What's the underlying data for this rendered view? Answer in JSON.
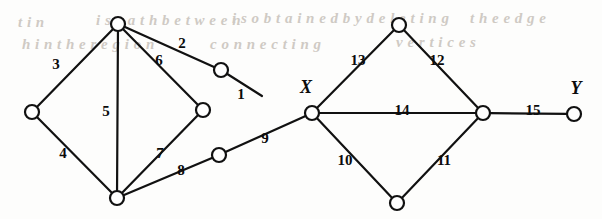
{
  "figure": {
    "kind": "undirected-weighted-graph",
    "background": "#fdfdfc",
    "ink_color": "#111111",
    "node_fill": "#ffffff",
    "node_radius": 7,
    "edge_stroke_width": 2.2
  },
  "ghost_text": [
    {
      "id": "g1",
      "text": "t i n",
      "x": 18,
      "y": 14,
      "size": 15,
      "rot": 0
    },
    {
      "id": "g2",
      "text": "i s   p a t h   b e t w e e n",
      "x": 96,
      "y": 12,
      "size": 15,
      "rot": 0
    },
    {
      "id": "g3",
      "text": "i s   o b t a i n e d   b y   d e l e t i n g",
      "x": 232,
      "y": 10,
      "size": 15,
      "rot": 0
    },
    {
      "id": "g4",
      "text": "t h e   e d g e",
      "x": 470,
      "y": 10,
      "size": 15,
      "rot": 0
    },
    {
      "id": "g5",
      "text": "h   i n   t h e   r e g i o n",
      "x": 22,
      "y": 36,
      "size": 15,
      "rot": 0
    },
    {
      "id": "g6",
      "text": "c o n n e c t i n g",
      "x": 210,
      "y": 36,
      "size": 15,
      "rot": 0
    },
    {
      "id": "g7",
      "text": "v e r t i c e s",
      "x": 396,
      "y": 34,
      "size": 15,
      "rot": 0
    }
  ],
  "nodes": [
    {
      "id": "a",
      "x": 118,
      "y": 24,
      "label": "",
      "label_dx": 0,
      "label_dy": 0
    },
    {
      "id": "b",
      "x": 32,
      "y": 112,
      "label": "",
      "label_dx": 0,
      "label_dy": 0
    },
    {
      "id": "c",
      "x": 117,
      "y": 198,
      "label": "",
      "label_dx": 0,
      "label_dy": 0
    },
    {
      "id": "d",
      "x": 203,
      "y": 110,
      "label": "",
      "label_dx": 0,
      "label_dy": 0
    },
    {
      "id": "e",
      "x": 221,
      "y": 70,
      "label": "",
      "label_dx": 0,
      "label_dy": 0
    },
    {
      "id": "f",
      "x": 219,
      "y": 155,
      "label": "",
      "label_dx": 0,
      "label_dy": 0
    },
    {
      "id": "x",
      "x": 312,
      "y": 113,
      "label": "X",
      "label_dx": -6,
      "label_dy": -24
    },
    {
      "id": "t",
      "x": 399,
      "y": 25,
      "label": "",
      "label_dx": 0,
      "label_dy": 0
    },
    {
      "id": "bm",
      "x": 397,
      "y": 203,
      "label": "",
      "label_dx": 0,
      "label_dy": 0
    },
    {
      "id": "r",
      "x": 483,
      "y": 113,
      "label": "",
      "label_dx": 0,
      "label_dy": 0
    },
    {
      "id": "y",
      "x": 574,
      "y": 114,
      "label": "Y",
      "label_dx": 2,
      "label_dy": -24
    }
  ],
  "edges": [
    {
      "id": "e1",
      "weight": "1",
      "from": "e",
      "to": "end1",
      "x2": 262,
      "y2": 96,
      "lx": 241,
      "ly": 96
    },
    {
      "id": "e2",
      "weight": "2",
      "from": "a",
      "to": "e",
      "x2": 0,
      "y2": 0,
      "lx": 182,
      "ly": 45
    },
    {
      "id": "e3",
      "weight": "3",
      "from": "a",
      "to": "b",
      "x2": 0,
      "y2": 0,
      "lx": 56,
      "ly": 66
    },
    {
      "id": "e4",
      "weight": "4",
      "from": "b",
      "to": "c",
      "x2": 0,
      "y2": 0,
      "lx": 63,
      "ly": 155
    },
    {
      "id": "e5",
      "weight": "5",
      "from": "a",
      "to": "c",
      "x2": 0,
      "y2": 0,
      "lx": 106,
      "ly": 113
    },
    {
      "id": "e6",
      "weight": "6",
      "from": "a",
      "to": "d",
      "x2": 0,
      "y2": 0,
      "lx": 159,
      "ly": 62
    },
    {
      "id": "e7",
      "weight": "7",
      "from": "d",
      "to": "c",
      "x2": 0,
      "y2": 0,
      "lx": 160,
      "ly": 155
    },
    {
      "id": "e8",
      "weight": "8",
      "from": "c",
      "to": "f",
      "x2": 0,
      "y2": 0,
      "lx": 181,
      "ly": 172
    },
    {
      "id": "e9",
      "weight": "9",
      "from": "f",
      "to": "x",
      "x2": 0,
      "y2": 0,
      "lx": 265,
      "ly": 140
    },
    {
      "id": "e10",
      "weight": "10",
      "from": "x",
      "to": "bm",
      "x2": 0,
      "y2": 0,
      "lx": 345,
      "ly": 162
    },
    {
      "id": "e11",
      "weight": "11",
      "from": "bm",
      "to": "r",
      "x2": 0,
      "y2": 0,
      "lx": 444,
      "ly": 162
    },
    {
      "id": "e12",
      "weight": "12",
      "from": "t",
      "to": "r",
      "x2": 0,
      "y2": 0,
      "lx": 437,
      "ly": 62
    },
    {
      "id": "e13",
      "weight": "13",
      "from": "x",
      "to": "t",
      "x2": 0,
      "y2": 0,
      "lx": 358,
      "ly": 62
    },
    {
      "id": "e14",
      "weight": "14",
      "from": "x",
      "to": "r",
      "x2": 0,
      "y2": 0,
      "lx": 402,
      "ly": 112
    },
    {
      "id": "e15",
      "weight": "15",
      "from": "r",
      "to": "y",
      "x2": 0,
      "y2": 0,
      "lx": 533,
      "ly": 112
    }
  ],
  "stub_edges": [
    {
      "id": "s1",
      "from": "e",
      "x2": 264,
      "y2": 96,
      "name": "edge-1-tail"
    }
  ]
}
